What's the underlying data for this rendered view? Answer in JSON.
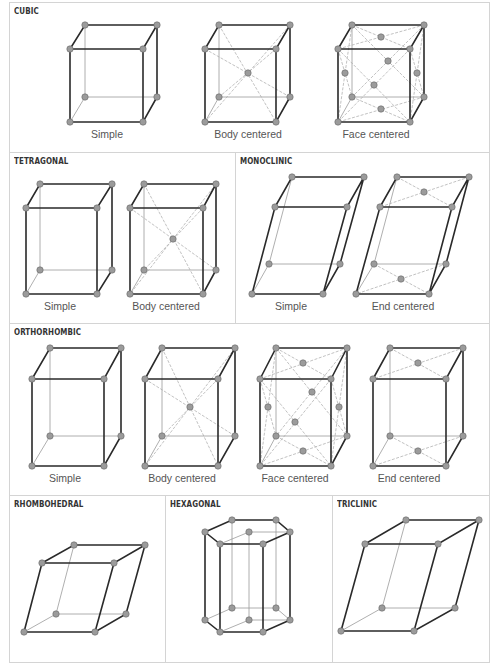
{
  "figure": {
    "sections": [
      {
        "id": "cubic",
        "title": "CUBIC",
        "lattices": [
          "Simple",
          "Body centered",
          "Face centered"
        ]
      },
      {
        "id": "tetragonal",
        "title": "TETRAGONAL",
        "lattices": [
          "Simple",
          "Body centered"
        ]
      },
      {
        "id": "monoclinic",
        "title": "MONOCLINIC",
        "lattices": [
          "Simple",
          "End centered"
        ]
      },
      {
        "id": "orthorhombic",
        "title": "ORTHORHOMBIC",
        "lattices": [
          "Simple",
          "Body centered",
          "Face centered",
          "End centered"
        ]
      },
      {
        "id": "rhombohedral",
        "title": "RHOMBOHEDRAL",
        "lattices": []
      },
      {
        "id": "hexagonal",
        "title": "HEXAGONAL",
        "lattices": []
      },
      {
        "id": "triclinic",
        "title": "TRICLINIC",
        "lattices": []
      }
    ]
  },
  "colors": {
    "edge": "#2a2a2a",
    "atom_fill": "#9b9b9b",
    "border": "#d4d4d4",
    "text": "#333333"
  }
}
